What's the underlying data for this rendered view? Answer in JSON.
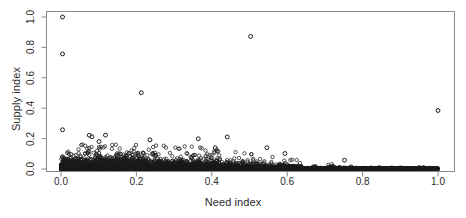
{
  "chart_data": {
    "type": "scatter",
    "title": "",
    "xlabel": "Need index",
    "ylabel": "Supply index",
    "xlim": [
      -0.03,
      1.05
    ],
    "ylim": [
      -0.02,
      1.02
    ],
    "xticks": [
      0.0,
      0.2,
      0.4,
      0.6,
      0.8,
      1.0
    ],
    "xtick_labels": [
      "0.0",
      "0.2",
      "0.4",
      "0.6",
      "0.8",
      "1.0"
    ],
    "yticks": [
      0.0,
      0.2,
      0.4,
      0.6,
      0.8,
      1.0
    ],
    "ytick_labels": [
      "0.0",
      "0.2",
      "0.4",
      "0.6",
      "0.8",
      "1.0"
    ],
    "grid": false,
    "legend": null,
    "marker": "open-circle",
    "marker_color": "#1a1a1a",
    "marker_radius": 1.7,
    "box": true,
    "notable_points": [
      {
        "x": 0.004,
        "y": 1.0,
        "label": "top-left outlier"
      },
      {
        "x": 0.004,
        "y": 0.757,
        "label": "left outlier"
      },
      {
        "x": 0.004,
        "y": 0.258,
        "label": "left mid outlier"
      },
      {
        "x": 0.213,
        "y": 0.502,
        "label": "mid outlier"
      },
      {
        "x": 0.503,
        "y": 0.872,
        "label": "center-top outlier"
      },
      {
        "x": 1.0,
        "y": 0.385,
        "label": "right outlier"
      },
      {
        "x": 0.075,
        "y": 0.222
      },
      {
        "x": 0.082,
        "y": 0.212
      },
      {
        "x": 0.118,
        "y": 0.223
      },
      {
        "x": 0.101,
        "y": 0.181
      },
      {
        "x": 0.236,
        "y": 0.192
      },
      {
        "x": 0.364,
        "y": 0.199
      },
      {
        "x": 0.441,
        "y": 0.211
      },
      {
        "x": 0.409,
        "y": 0.139
      },
      {
        "x": 0.546,
        "y": 0.14
      },
      {
        "x": 0.594,
        "y": 0.102
      },
      {
        "x": 0.752,
        "y": 0.058
      }
    ],
    "n_points_approx": 4000
  },
  "figure": {
    "background": "#ffffff",
    "axis_color": "#808080",
    "text_color": "#2b2b2b"
  }
}
